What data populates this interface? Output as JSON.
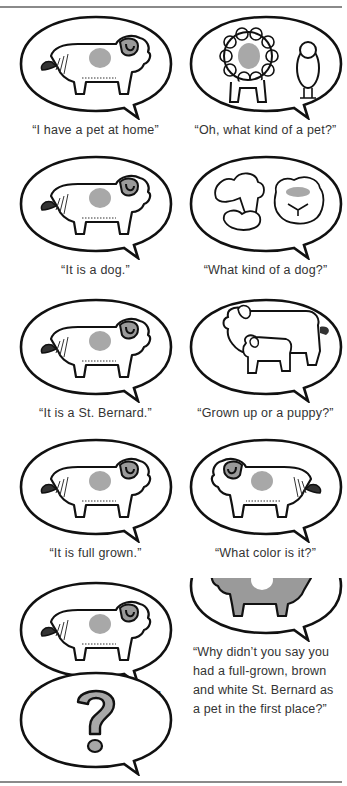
{
  "page": {
    "layout": "two-column dialogue panels",
    "colors": {
      "ink": "#111111",
      "shade": "#a8a8a8",
      "caption": "#333333",
      "rule": "#8a8a8a"
    }
  },
  "panels": [
    {
      "side": "left",
      "illustration": "dog-icon",
      "caption": "“I have a pet at home”"
    },
    {
      "side": "right",
      "illustration": "lion-and-bird-icon",
      "caption": "“Oh, what kind of a pet?”"
    },
    {
      "side": "left",
      "illustration": "dog-icon",
      "caption": "“It is a dog.”"
    },
    {
      "side": "right",
      "illustration": "poodle-and-bulldog-icon",
      "caption": "“What kind of a dog?”"
    },
    {
      "side": "left",
      "illustration": "dog-icon",
      "caption": "“It is a St. Bernard.”"
    },
    {
      "side": "right",
      "illustration": "dog-and-puppy-icon",
      "caption": "“Grown up or a puppy?”"
    },
    {
      "side": "left",
      "illustration": "dog-icon",
      "caption": "“It is full grown.”"
    },
    {
      "side": "right",
      "illustration": "dog-facing-left-icon",
      "caption": "“What color is it?”"
    },
    {
      "side": "left",
      "illustration": "dog-icon",
      "caption": "“It is brown and white.”"
    },
    {
      "side": "right",
      "illustration": "dark-dog-icon",
      "caption": ""
    },
    {
      "side": "left",
      "illustration": "question-mark-icon",
      "caption": ""
    }
  ],
  "final_text": "“Why didn’t you say you had a full-grown, brown and white St. Bernard as a pet in the first place?”"
}
